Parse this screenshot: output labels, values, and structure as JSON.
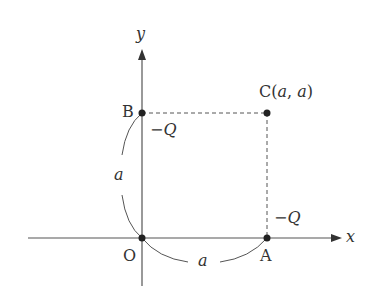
{
  "diagram": {
    "axes": {
      "x_label": "x",
      "y_label": "y"
    },
    "points": {
      "origin": {
        "label": "O"
      },
      "A": {
        "label": "A",
        "charge": "−Q"
      },
      "B": {
        "label": "B",
        "charge": "−Q"
      },
      "C": {
        "label": "C",
        "coords_open": "(",
        "coord_a1": "a",
        "comma": ",",
        "coord_a2": "a",
        "coords_close": ")"
      }
    },
    "distances": {
      "OB": "a",
      "OA": "a"
    },
    "colors": {
      "line": "#555555",
      "point": "#222222"
    }
  }
}
